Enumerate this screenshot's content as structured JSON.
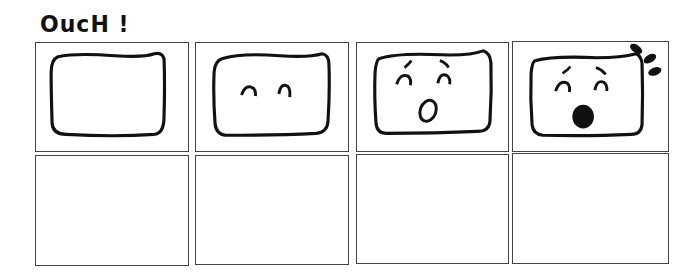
{
  "comic": {
    "title": "OucH !",
    "rows": [
      {
        "panels": [
          {
            "id": 1,
            "content": "blank-face",
            "description": "Empty rounded square face outline"
          },
          {
            "id": 2,
            "content": "face-eyes",
            "description": "Face with two arched eyes"
          },
          {
            "id": 3,
            "content": "face-surprised",
            "description": "Face with worried eyebrows, arched eyes, open 'o' mouth"
          },
          {
            "id": 4,
            "content": "face-shocked",
            "description": "Face with worried eyebrows, arched eyes, filled open mouth, impact marks at top-right"
          }
        ]
      },
      {
        "panels": [
          {
            "id": 5,
            "content": "empty"
          },
          {
            "id": 6,
            "content": "empty"
          },
          {
            "id": 7,
            "content": "empty"
          },
          {
            "id": 8,
            "content": "empty"
          }
        ]
      }
    ],
    "colors": {
      "ink": "#111111",
      "border": "#444444",
      "background": "#ffffff"
    }
  }
}
